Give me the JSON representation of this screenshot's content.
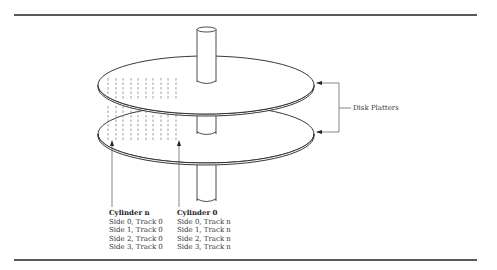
{
  "diagram": {
    "callout_label": "Disk Platters",
    "cylinder_n": {
      "title": "Cylinder n",
      "lines": [
        "Side 0, Track 0",
        "Side 1, Track 0",
        "Side 2, Track 0",
        "Side 3, Track 0"
      ]
    },
    "cylinder_0": {
      "title": "Cylinder 0",
      "lines": [
        "Side 0, Track n",
        "Side 1, Track n",
        "Side 2, Track n",
        "Side 3, Track n"
      ]
    },
    "platter_count": 2,
    "colors": {
      "line": "#222222",
      "track": "#777777",
      "background": "#ffffff"
    }
  }
}
